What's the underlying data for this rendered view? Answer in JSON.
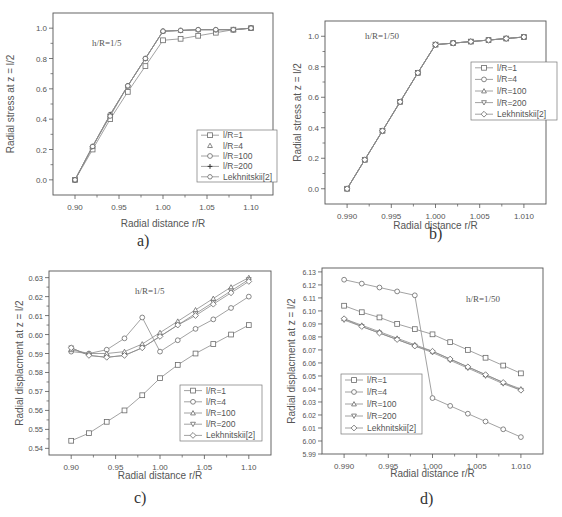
{
  "captions": [
    "a)",
    "b)",
    "c)",
    "d)"
  ],
  "chart_data": [
    {
      "id": "a",
      "type": "line",
      "title": "",
      "annotation": "h/R=1/5",
      "xlabel": "Radial distance r/R",
      "ylabel": "Radial stress at z = l/2",
      "xlim": [
        0.875,
        1.125
      ],
      "ylim": [
        -0.1,
        1.1
      ],
      "xticks": [
        0.9,
        0.95,
        1.0,
        1.05,
        1.1
      ],
      "xtick_labels": [
        "0.90",
        "0.95",
        "1.00",
        "1.05",
        "1.10"
      ],
      "yticks": [
        0.0,
        0.2,
        0.4,
        0.6,
        0.8,
        1.0
      ],
      "ytick_labels": [
        "0.0",
        "0.2",
        "0.4",
        "0.6",
        "0.8",
        "1.0"
      ],
      "grid": false,
      "legend_position": "lower right",
      "x": [
        0.9,
        0.92,
        0.94,
        0.96,
        0.98,
        1.0,
        1.02,
        1.04,
        1.06,
        1.08,
        1.1
      ],
      "series": [
        {
          "name": "l/R=1",
          "marker": "square",
          "values": [
            0.0,
            0.2,
            0.4,
            0.58,
            0.75,
            0.92,
            0.93,
            0.95,
            0.97,
            0.99,
            1.0
          ]
        },
        {
          "name": "l/R=4",
          "marker": "triangle-up",
          "values": [
            0.0,
            0.22,
            0.43,
            0.62,
            0.8,
            0.98,
            0.985,
            0.99,
            0.99,
            0.99,
            1.0
          ]
        },
        {
          "name": "l/R=100",
          "marker": "circle",
          "values": [
            0.0,
            0.22,
            0.43,
            0.62,
            0.8,
            0.98,
            0.985,
            0.99,
            0.99,
            0.99,
            1.0
          ]
        },
        {
          "name": "l/R=200",
          "marker": "plus",
          "values": [
            0.0,
            0.22,
            0.43,
            0.62,
            0.8,
            0.98,
            0.985,
            0.99,
            0.99,
            0.99,
            1.0
          ]
        },
        {
          "name": "Lekhnitskii[2]",
          "marker": "hexagon",
          "values": [
            0.0,
            0.22,
            0.42,
            0.62,
            0.8,
            0.98,
            0.985,
            0.99,
            0.99,
            0.99,
            1.0
          ]
        }
      ]
    },
    {
      "id": "b",
      "type": "line",
      "title": "",
      "annotation": "h/R=1/50",
      "xlabel": "Radial distance r/R",
      "ylabel": "Radial stress at z = l/2",
      "xlim": [
        0.9875,
        1.0125
      ],
      "ylim": [
        -0.1,
        1.1
      ],
      "xticks": [
        0.99,
        0.995,
        1.0,
        1.005,
        1.01
      ],
      "xtick_labels": [
        "0.990",
        "0.995",
        "1.000",
        "1.005",
        "1.010"
      ],
      "yticks": [
        0.0,
        0.2,
        0.4,
        0.6,
        0.8,
        1.0
      ],
      "ytick_labels": [
        "0.0",
        "0.2",
        "0.4",
        "0.6",
        "0.8",
        "1.0"
      ],
      "grid": false,
      "legend_position": "upper right",
      "x": [
        0.99,
        0.992,
        0.994,
        0.996,
        0.998,
        1.0,
        1.002,
        1.004,
        1.006,
        1.008,
        1.01
      ],
      "series": [
        {
          "name": "l/R=1",
          "marker": "square",
          "values": [
            0.0,
            0.19,
            0.38,
            0.57,
            0.76,
            0.945,
            0.955,
            0.965,
            0.975,
            0.985,
            0.995
          ]
        },
        {
          "name": "l/R=4",
          "marker": "circle",
          "values": [
            0.0,
            0.19,
            0.38,
            0.57,
            0.76,
            0.945,
            0.955,
            0.965,
            0.975,
            0.985,
            0.995
          ]
        },
        {
          "name": "l/R=100",
          "marker": "triangle-up",
          "values": [
            0.0,
            0.19,
            0.38,
            0.57,
            0.76,
            0.945,
            0.955,
            0.965,
            0.975,
            0.985,
            0.995
          ]
        },
        {
          "name": "l/R=200",
          "marker": "triangle-down",
          "values": [
            0.0,
            0.19,
            0.38,
            0.57,
            0.76,
            0.945,
            0.955,
            0.965,
            0.975,
            0.985,
            0.995
          ]
        },
        {
          "name": "Lekhnitskii[2]",
          "marker": "diamond",
          "values": [
            0.0,
            0.19,
            0.38,
            0.57,
            0.76,
            0.945,
            0.955,
            0.965,
            0.975,
            0.985,
            0.995
          ]
        }
      ]
    },
    {
      "id": "c",
      "type": "line",
      "title": "",
      "annotation": "h/R=1/5",
      "xlabel": "Radial distance r/R",
      "ylabel": "Radial displacment at z = l/2",
      "xlim": [
        0.875,
        1.125
      ],
      "ylim": [
        0.5365,
        0.6335
      ],
      "xticks": [
        0.9,
        0.95,
        1.0,
        1.05,
        1.1
      ],
      "xtick_labels": [
        "0.90",
        "0.95",
        "1.00",
        "1.05",
        "1.10"
      ],
      "yticks": [
        0.54,
        0.55,
        0.56,
        0.57,
        0.58,
        0.59,
        0.6,
        0.61,
        0.62,
        0.63
      ],
      "ytick_labels": [
        "0.54",
        "0.55",
        "0.56",
        "0.57",
        "0.58",
        "0.59",
        "0.60",
        "0.61",
        "0.62",
        "0.63"
      ],
      "grid": false,
      "legend_position": "lower right",
      "x": [
        0.9,
        0.92,
        0.94,
        0.96,
        0.98,
        1.0,
        1.02,
        1.04,
        1.06,
        1.08,
        1.1
      ],
      "series": [
        {
          "name": "l/R=1",
          "marker": "square",
          "values": [
            0.544,
            0.548,
            0.554,
            0.56,
            0.568,
            0.577,
            0.584,
            0.59,
            0.595,
            0.6,
            0.605
          ]
        },
        {
          "name": "l/R=4",
          "marker": "circle",
          "values": [
            0.591,
            0.59,
            0.592,
            0.598,
            0.609,
            0.591,
            0.597,
            0.603,
            0.608,
            0.614,
            0.62
          ]
        },
        {
          "name": "l/R=100",
          "marker": "triangle-up",
          "values": [
            0.592,
            0.59,
            0.59,
            0.591,
            0.595,
            0.601,
            0.607,
            0.613,
            0.619,
            0.625,
            0.63
          ]
        },
        {
          "name": "l/R=200",
          "marker": "triangle-down",
          "values": [
            0.593,
            0.589,
            0.588,
            0.589,
            0.593,
            0.599,
            0.605,
            0.611,
            0.617,
            0.623,
            0.629
          ]
        },
        {
          "name": "Lekhnitskii[2]",
          "marker": "diamond",
          "values": [
            0.593,
            0.589,
            0.588,
            0.589,
            0.593,
            0.599,
            0.605,
            0.61,
            0.616,
            0.622,
            0.628
          ]
        }
      ]
    },
    {
      "id": "d",
      "type": "line",
      "title": "",
      "annotation": "h/R=1/50",
      "xlabel": "Radial distance r/R",
      "ylabel": "Radial displacment at z = l/2",
      "xlim": [
        0.9875,
        1.0125
      ],
      "ylim": [
        5.99,
        6.133
      ],
      "xticks": [
        0.99,
        0.995,
        1.0,
        1.005,
        1.01
      ],
      "xtick_labels": [
        "0.990",
        "0.995",
        "1.000",
        "1.005",
        "1.010"
      ],
      "yticks": [
        5.99,
        6.0,
        6.01,
        6.02,
        6.03,
        6.04,
        6.05,
        6.06,
        6.07,
        6.08,
        6.09,
        6.1,
        6.11,
        6.12,
        6.13
      ],
      "ytick_labels": [
        "5.99",
        "6.00",
        "6.01",
        "6.02",
        "6.03",
        "6.04",
        "6.05",
        "6.06",
        "6.07",
        "6.08",
        "6.09",
        "6.10",
        "6.11",
        "6.12",
        "6.13"
      ],
      "grid": false,
      "legend_position": "lower left",
      "x": [
        0.99,
        0.992,
        0.994,
        0.996,
        0.998,
        1.0,
        1.002,
        1.004,
        1.006,
        1.008,
        1.01
      ],
      "series": [
        {
          "name": "l/R=1",
          "marker": "square",
          "values": [
            6.104,
            6.099,
            6.095,
            6.09,
            6.086,
            6.082,
            6.076,
            6.07,
            6.064,
            6.058,
            6.052
          ]
        },
        {
          "name": "l/R=4",
          "marker": "circle",
          "values": [
            6.124,
            6.121,
            6.118,
            6.115,
            6.112,
            6.033,
            6.027,
            6.021,
            6.015,
            6.009,
            6.003
          ]
        },
        {
          "name": "l/R=100",
          "marker": "triangle-up",
          "values": [
            6.094,
            6.089,
            6.084,
            6.079,
            6.074,
            6.069,
            6.063,
            6.057,
            6.051,
            6.045,
            6.04
          ]
        },
        {
          "name": "l/R=200",
          "marker": "triangle-down",
          "values": [
            6.093,
            6.088,
            6.083,
            6.078,
            6.073,
            6.068,
            6.062,
            6.056,
            6.05,
            6.044,
            6.039
          ]
        },
        {
          "name": "Lekhnitskii[2]",
          "marker": "diamond",
          "values": [
            6.094,
            6.088,
            6.083,
            6.078,
            6.073,
            6.069,
            6.063,
            6.057,
            6.051,
            6.045,
            6.039
          ]
        }
      ]
    }
  ],
  "legends": [
    {
      "items": [
        {
          "label": "l/R=1",
          "marker": "square",
          "line": true
        },
        {
          "label": "l/R=4",
          "marker": "triangle-up",
          "line": false
        },
        {
          "label": "l/R=100",
          "marker": "circle",
          "line": true
        },
        {
          "label": "l/R=200",
          "marker": "plus",
          "line": true
        },
        {
          "label": "Lekhnitskii[2]",
          "marker": "hexagon",
          "line": true
        }
      ]
    },
    {
      "items": [
        {
          "label": "l/R=1",
          "marker": "square",
          "line": true
        },
        {
          "label": "l/R=4",
          "marker": "circle",
          "line": true
        },
        {
          "label": "l/R=100",
          "marker": "triangle-up",
          "line": true
        },
        {
          "label": "l/R=200",
          "marker": "triangle-down",
          "line": true
        },
        {
          "label": "Lekhnitskii[2]",
          "marker": "diamond",
          "line": true
        }
      ]
    },
    {
      "items": [
        {
          "label": "l/R=1",
          "marker": "square",
          "line": true
        },
        {
          "label": "l/R=4",
          "marker": "circle",
          "line": true
        },
        {
          "label": "l/R=100",
          "marker": "triangle-up",
          "line": true
        },
        {
          "label": "l/R=200",
          "marker": "triangle-down",
          "line": true
        },
        {
          "label": "Lekhnitskii[2]",
          "marker": "diamond",
          "line": true
        }
      ]
    },
    {
      "items": [
        {
          "label": "l/R=1",
          "marker": "square",
          "line": true
        },
        {
          "label": "l/R=4",
          "marker": "circle",
          "line": true
        },
        {
          "label": "l/R=100",
          "marker": "triangle-up",
          "line": true
        },
        {
          "label": "l/R=200",
          "marker": "triangle-down",
          "line": true
        },
        {
          "label": "Lekhnitskii[2]",
          "marker": "diamond",
          "line": true
        }
      ]
    }
  ],
  "colors": {
    "line": "#8a8a8a",
    "frame": "#555555",
    "text": "#555555",
    "background": "#ffffff"
  }
}
